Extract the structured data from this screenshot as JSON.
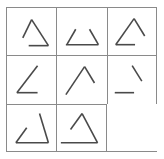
{
  "puzzle": {
    "title": "Matrix Reasoning Puzzle",
    "type": "raven-progressive-matrix",
    "rows": 3,
    "columns": 3,
    "blank_cell_index": 8,
    "colors": {
      "stroke": "#4a4a4a",
      "grid": "#8a8a8a",
      "background": "#ffffff"
    },
    "cells": [
      {
        "index": 0,
        "position": "row1-col1",
        "name": "cell-r1c1",
        "description": "Triangle with apex at top, both slanted sides present, short horizontal base on the right",
        "segments": [
          {
            "name": "left-diagonal",
            "x1": 16,
            "y1": 31,
            "x2": 25,
            "y2": 12
          },
          {
            "name": "right-diagonal",
            "x1": 25,
            "y1": 12,
            "x2": 42,
            "y2": 39
          },
          {
            "name": "base-horizontal",
            "x1": 22,
            "y1": 39,
            "x2": 42,
            "y2": 39
          }
        ]
      },
      {
        "index": 1,
        "position": "row1-col2",
        "name": "cell-r1c2",
        "description": "Two short opposing diagonals with a full horizontal base; apex missing",
        "segments": [
          {
            "name": "left-diagonal",
            "x1": 10,
            "y1": 38,
            "x2": 19,
            "y2": 22
          },
          {
            "name": "right-diagonal",
            "x1": 33,
            "y1": 22,
            "x2": 42,
            "y2": 38
          },
          {
            "name": "base-horizontal",
            "x1": 9,
            "y1": 38,
            "x2": 42,
            "y2": 38
          }
        ]
      },
      {
        "index": 2,
        "position": "row1-col3",
        "name": "cell-r1c3",
        "description": "Triangle with apex at top, long left diagonal, right diagonal, short horizontal base on the left",
        "segments": [
          {
            "name": "left-diagonal",
            "x1": 8,
            "y1": 38,
            "x2": 27,
            "y2": 11
          },
          {
            "name": "right-diagonal",
            "x1": 27,
            "y1": 11,
            "x2": 38,
            "y2": 29
          },
          {
            "name": "base-horizontal",
            "x1": 8,
            "y1": 38,
            "x2": 28,
            "y2": 38
          }
        ]
      },
      {
        "index": 3,
        "position": "row2-col1",
        "name": "cell-r2c1",
        "description": "Angle shape: one long rising diagonal plus short horizontal base, right side missing",
        "segments": [
          {
            "name": "left-diagonal",
            "x1": 10,
            "y1": 38,
            "x2": 31,
            "y2": 10
          },
          {
            "name": "base-horizontal",
            "x1": 10,
            "y1": 38,
            "x2": 31,
            "y2": 38
          }
        ]
      },
      {
        "index": 4,
        "position": "row2-col2",
        "name": "cell-r2c2",
        "description": "Inverted V caret: long left diagonal to apex plus short right diagonal, base missing",
        "segments": [
          {
            "name": "left-diagonal",
            "x1": 9,
            "y1": 40,
            "x2": 28,
            "y2": 11
          },
          {
            "name": "right-diagonal",
            "x1": 28,
            "y1": 11,
            "x2": 38,
            "y2": 28
          }
        ]
      },
      {
        "index": 5,
        "position": "row2-col3",
        "name": "cell-r2c3",
        "description": "Short descending diagonal at upper right plus a detached horizontal segment at lower left",
        "segments": [
          {
            "name": "right-diagonal",
            "x1": 25,
            "y1": 10,
            "x2": 35,
            "y2": 26
          },
          {
            "name": "base-horizontal",
            "x1": 7,
            "y1": 38,
            "x2": 27,
            "y2": 38
          }
        ]
      },
      {
        "index": 6,
        "position": "row3-col1",
        "name": "cell-r3c1",
        "description": "Triangle with short left diagonal, long right descending diagonal, horizontal base",
        "segments": [
          {
            "name": "left-diagonal",
            "x1": 9,
            "y1": 40,
            "x2": 20,
            "y2": 24
          },
          {
            "name": "right-diagonal",
            "x1": 33,
            "y1": 9,
            "x2": 42,
            "y2": 40
          },
          {
            "name": "base-horizontal",
            "x1": 9,
            "y1": 40,
            "x2": 42,
            "y2": 40
          }
        ]
      },
      {
        "index": 7,
        "position": "row3-col2",
        "name": "cell-r3c2",
        "description": "Triangle with apex at top, short left diagonal, long right diagonal, long horizontal base",
        "segments": [
          {
            "name": "left-diagonal",
            "x1": 14,
            "y1": 26,
            "x2": 26,
            "y2": 9
          },
          {
            "name": "right-diagonal",
            "x1": 26,
            "y1": 9,
            "x2": 42,
            "y2": 40
          },
          {
            "name": "base-horizontal",
            "x1": 4,
            "y1": 40,
            "x2": 42,
            "y2": 40
          }
        ]
      },
      {
        "index": 8,
        "position": "row3-col3",
        "name": "cell-r3c3-blank",
        "description": "Blank cell (missing piece)",
        "segments": []
      }
    ]
  }
}
